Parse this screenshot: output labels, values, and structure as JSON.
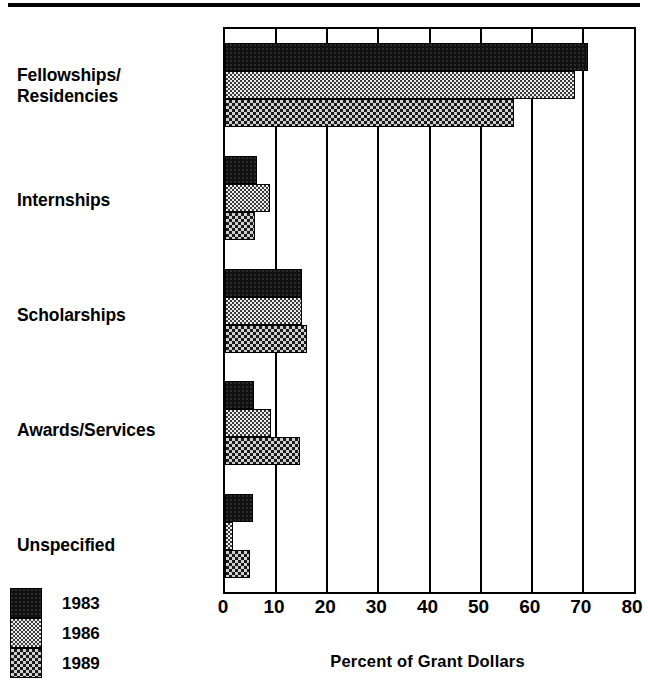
{
  "chart_data": {
    "type": "bar",
    "orientation": "horizontal",
    "title": "",
    "xlabel": "Percent of  Grant Dollars",
    "ylabel": "",
    "xlim": [
      0,
      80
    ],
    "xticks": [
      0,
      10,
      20,
      30,
      40,
      50,
      60,
      70,
      80
    ],
    "grid": true,
    "legend_position": "bottom-left",
    "categories": [
      "Fellowships/\nResidencies",
      "Internships",
      "Scholarships",
      "Awards/Services",
      "Unspecified"
    ],
    "series": [
      {
        "name": "1983",
        "values": [
          71,
          6.3,
          15,
          5.7,
          5.5
        ]
      },
      {
        "name": "1986",
        "values": [
          68.5,
          8.8,
          15,
          9,
          1.5
        ]
      },
      {
        "name": "1989",
        "values": [
          56.5,
          5.9,
          16,
          14.7,
          4.9
        ]
      }
    ]
  },
  "legend": {
    "items": [
      {
        "label": "1983",
        "pattern": "solid-black"
      },
      {
        "label": "1986",
        "pattern": "light-checker"
      },
      {
        "label": "1989",
        "pattern": "dark-checker"
      }
    ]
  },
  "axis": {
    "tick_labels": [
      "0",
      "10",
      "20",
      "30",
      "40",
      "50",
      "60",
      "70",
      "80"
    ],
    "title": "Percent of  Grant Dollars"
  },
  "colors": {
    "ink": "#000000",
    "paper": "#ffffff",
    "series_1983": "#111111",
    "series_1986": "#e8e8e8",
    "series_1989": "#555555"
  }
}
